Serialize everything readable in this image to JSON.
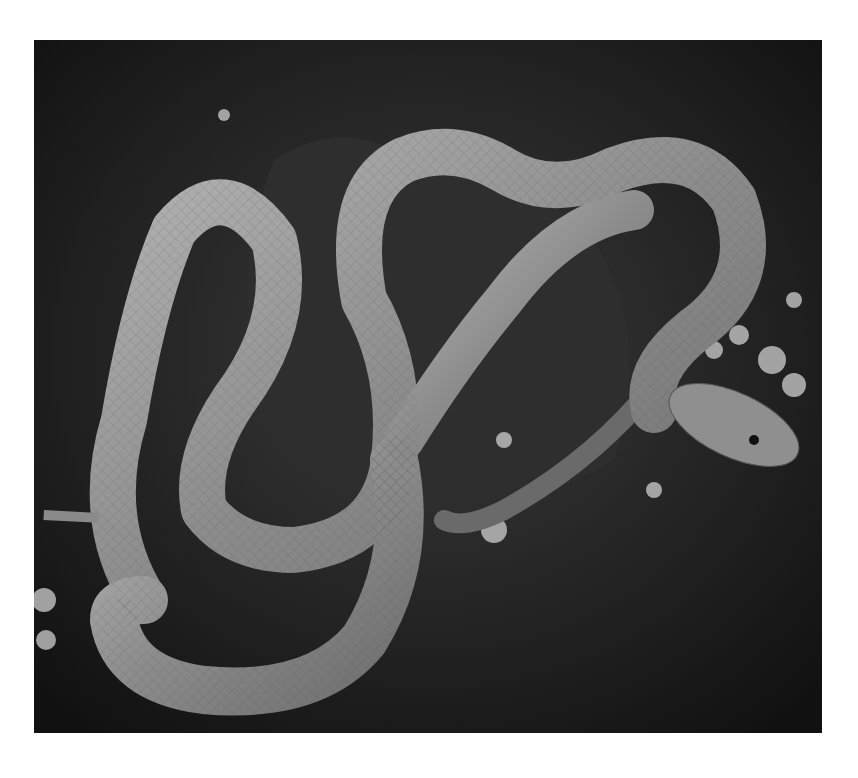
{
  "image": {
    "subject": "snake coiled on moss and rock",
    "colors": {
      "background": "#ffffff",
      "ground": "#1c1c1c",
      "snake_body": "#8a8a8a",
      "snake_highlight": "#bdbdbd",
      "moss": "#d8d8d8"
    }
  }
}
